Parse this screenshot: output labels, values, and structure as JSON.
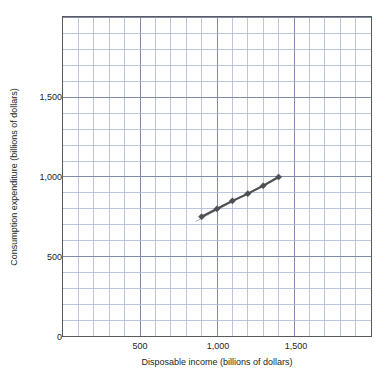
{
  "chart_data": {
    "type": "scatter",
    "title": "",
    "subtitle": "",
    "xlabel": "Disposable income (billions of dollars)",
    "ylabel": "Consumption expenditure (billions of dollars)",
    "xlim": [
      0,
      2000
    ],
    "ylim": [
      0,
      2000
    ],
    "x_ticks": [
      {
        "value": 500,
        "label": "500"
      },
      {
        "value": 1000,
        "label": "1,000"
      },
      {
        "value": 1500,
        "label": "1,500"
      }
    ],
    "y_ticks": [
      {
        "value": 0,
        "label": "0"
      },
      {
        "value": 500,
        "label": "500"
      },
      {
        "value": 1000,
        "label": "1,000"
      },
      {
        "value": 1500,
        "label": "1,500"
      }
    ],
    "grid": {
      "visible": true,
      "minor_step_x": 100,
      "minor_step_y": 100,
      "major_step_x": 500,
      "major_step_y": 500,
      "minor_color": "#aab7d4",
      "major_color": "#7d8ba8"
    },
    "axis_color": "#58595b",
    "series": [
      {
        "name": "Consumption function",
        "marker": "diamond",
        "marker_color": "#4d4f53",
        "line_color": "#4d4f53",
        "line_style": "solid",
        "points": [
          {
            "x": 900,
            "y": 750
          },
          {
            "x": 1000,
            "y": 800
          },
          {
            "x": 1100,
            "y": 850
          },
          {
            "x": 1200,
            "y": 895
          },
          {
            "x": 1300,
            "y": 945
          },
          {
            "x": 1400,
            "y": 1000
          }
        ],
        "trend_extension": {
          "x_start": 860,
          "y_start": 720,
          "x_end": 1410,
          "y_end": 1003
        }
      }
    ],
    "legend": {
      "visible": false,
      "position": "none"
    },
    "annotations": []
  }
}
